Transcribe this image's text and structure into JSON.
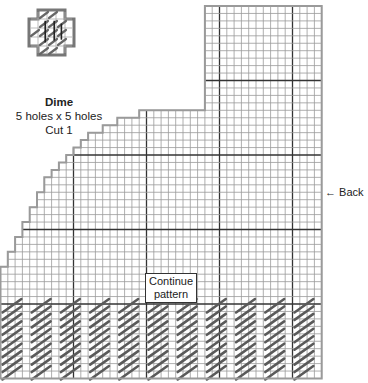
{
  "piece": {
    "name": "Dime",
    "size": "5 holes x 5 holes",
    "cut": "Cut 1"
  },
  "icon_motif": {
    "name": "dime-motif-icon",
    "holes": 5
  },
  "grid": {
    "columns": 44,
    "rows": 50,
    "major_every": 10,
    "column_tops": [
      35,
      33,
      31,
      29,
      27,
      25,
      23,
      22,
      21,
      20,
      19,
      18,
      17,
      17,
      16,
      16,
      15,
      15,
      15,
      14,
      14,
      14,
      14,
      14,
      14,
      14,
      14,
      14,
      0,
      0,
      0,
      0,
      0,
      0,
      0,
      0,
      0,
      0,
      0,
      0,
      0,
      0,
      0,
      0
    ],
    "line_color": "#9a9a9a",
    "major_line_color": "#333333",
    "border_color": "#9a9a9a"
  },
  "stitches": {
    "first_row": 40,
    "last_row": 49,
    "group_repeat_cols": 4,
    "stitch_span_cols": 3,
    "group_count": 11,
    "color": "#5a5a5a"
  },
  "labels": {
    "continue_line1": "Continue",
    "continue_line2": "pattern",
    "back": "← Back"
  }
}
